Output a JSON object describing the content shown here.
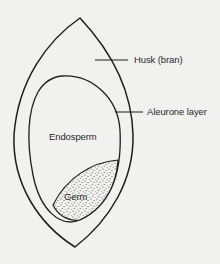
{
  "diagram": {
    "colors": {
      "background": "#f1f1ef",
      "stroke": "#1e1e1e",
      "text": "#2a2a2a",
      "stipple": "#3a3a3a"
    },
    "labels": {
      "husk": "Husk (bran)",
      "aleurone": "Aleurone layer",
      "endosperm": "Endosperm",
      "germ": "Germ"
    },
    "parts": [
      {
        "id": "husk",
        "label": "Husk (bran)",
        "type": "outer-shell"
      },
      {
        "id": "aleurone",
        "label": "Aleurone layer",
        "type": "inner-boundary"
      },
      {
        "id": "endosperm",
        "label": "Endosperm",
        "type": "region"
      },
      {
        "id": "germ",
        "label": "Germ",
        "type": "stippled-region"
      }
    ]
  }
}
